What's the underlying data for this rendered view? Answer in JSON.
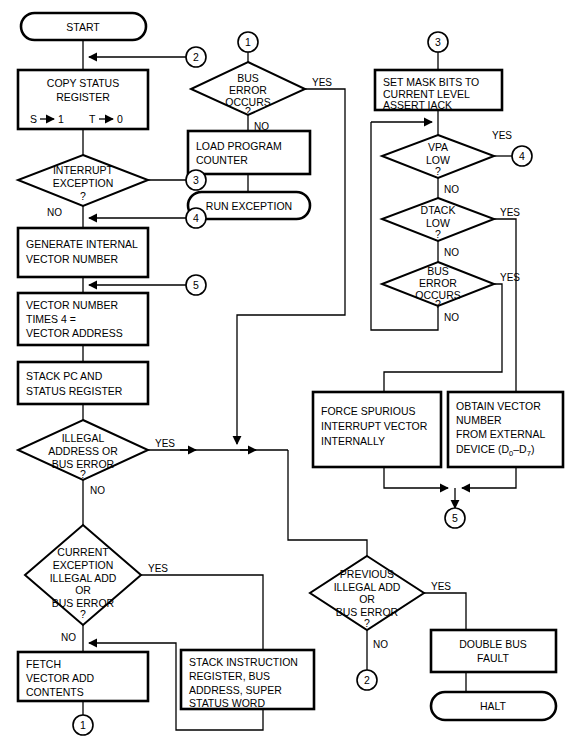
{
  "diagram": {
    "type": "flowchart",
    "colors": {
      "stroke": "#000000",
      "fill": "#ffffff",
      "background": "#ffffff"
    }
  },
  "terminals": {
    "start": "START",
    "run_exception": "RUN EXCEPTION",
    "halt": "HALT"
  },
  "processes": {
    "copy_status_register": {
      "line1": "COPY STATUS",
      "line2": "REGISTER",
      "line3a": "S",
      "line3b": "1",
      "line3c": "T",
      "line3d": "0"
    },
    "generate_internal_vector": {
      "line1": "GENERATE  INTERNAL",
      "line2": "VECTOR  NUMBER"
    },
    "vector_times_four": {
      "line1": "VECTOR NUMBER",
      "line2": "TIMES 4  =",
      "line3": "VECTOR ADDRESS"
    },
    "stack_pc_status": {
      "line1": "STACK PC  AND",
      "line2": "STATUS  REGISTER"
    },
    "fetch_vector_add": {
      "line1": "FETCH",
      "line2": "VECTOR ADD",
      "line3": "CONTENTS"
    },
    "stack_instruction": {
      "line1": "STACK   INSTRUCTION",
      "line2": "REGISTER, BUS",
      "line3": "ADDRESS, SUPER",
      "line4": "STATUS WORD"
    },
    "load_program_counter": {
      "line1": "LOAD  PROGRAM",
      "line2": "COUNTER"
    },
    "set_mask_bits": {
      "line1": "SET MASK  BITS TO",
      "line2": "CURRENT LEVEL",
      "line3": "ASSERT  IACK"
    },
    "force_spurious": {
      "line1": "FORCE  SPURIOUS",
      "line2": "INTERRUPT  VECTOR",
      "line3": "INTERNALLY"
    },
    "obtain_vector": {
      "line1": "OBTAIN VECTOR",
      "line2": "NUMBER",
      "line3": "FROM EXTERNAL",
      "line4a": "DEVICE (D",
      "line4b": "0",
      "line4c": "–D",
      "line4d": "7",
      "line4e": ")"
    },
    "double_bus_fault": {
      "line1": "DOUBLE  BUS",
      "line2": "FAULT"
    }
  },
  "decisions": {
    "interrupt_exception": {
      "line1": "INTERRUPT",
      "line2": "EXCEPTION",
      "line3": "?"
    },
    "illegal_address_or_bus_error": {
      "line1": "ILLEGAL",
      "line2": "ADDRESS OR",
      "line3": "BUS ERROR",
      "line4": "?"
    },
    "current_exception": {
      "line1": "CURRENT",
      "line2": "EXCEPTION",
      "line3": "ILLEGAL ADD",
      "line4": "OR",
      "line5": "BUS ERROR",
      "line6": "?"
    },
    "bus_error_occurs_mid": {
      "line1": "BUS",
      "line2": "ERROR",
      "line3": "OCCURS",
      "line4": "?"
    },
    "previous_illegal_add": {
      "line1": "PREVIOUS",
      "line2": "ILLEGAL ADD",
      "line3": "OR",
      "line4": "BUS ERROR",
      "line5": "?"
    },
    "vpa_low": {
      "line1": "VPA",
      "line2": "LOW",
      "line3": "?"
    },
    "dtack_low": {
      "line1": "DTACK",
      "line2": "LOW",
      "line3": "?"
    },
    "bus_error_occurs_right": {
      "line1": "BUS",
      "line2": "ERROR",
      "line3": "OCCURS",
      "line4": "?"
    }
  },
  "branch_labels": {
    "yes": "YES",
    "no": "NO"
  },
  "connector_tags": {
    "one": "1",
    "two": "2",
    "three": "3",
    "four": "4",
    "five": "5"
  },
  "connector_labels": {
    "left_in_2": "2",
    "left_in_3": "3",
    "left_in_4": "4",
    "left_in_5": "5",
    "mid_top_1": "1",
    "right_top_3": "3",
    "right_vpa_4": "4",
    "mid_five": "5",
    "bottom_one": "1",
    "bottom_two": "2"
  }
}
